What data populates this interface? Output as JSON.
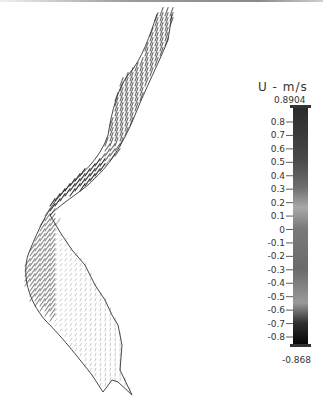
{
  "chart_data": {
    "type": "vector-field",
    "title": "",
    "colorbar": {
      "label": "U - m/s",
      "max_label": "0.8904",
      "min_label": "-0.868",
      "max": 0.8904,
      "min": -0.868,
      "ticks": [
        0.8,
        0.7,
        0.6,
        0.5,
        0.4,
        0.3,
        0.2,
        0.1,
        0,
        -0.1,
        -0.2,
        -0.3,
        -0.4,
        -0.5,
        -0.6,
        -0.7,
        -0.8
      ],
      "tick_labels": [
        "0.8",
        "0.7",
        "0.6",
        "0.5",
        "0.4",
        "0.3",
        "0.2",
        "0.1",
        "0",
        "-0.1",
        "-0.2",
        "-0.3",
        "-0.4",
        "-0.5",
        "-0.6",
        "-0.7",
        "-0.8"
      ],
      "colormap": [
        {
          "value": 0.8904,
          "color": "#2a2a2a"
        },
        {
          "value": 0.5,
          "color": "#4a4a4a"
        },
        {
          "value": 0.3,
          "color": "#6e6e6e"
        },
        {
          "value": 0.15,
          "color": "#a9a9a9"
        },
        {
          "value": 0.0,
          "color": "#7a7a7a"
        },
        {
          "value": -0.3,
          "color": "#6a6a6a"
        },
        {
          "value": -0.55,
          "color": "#9a9a9a"
        },
        {
          "value": -0.7,
          "color": "#2e2e2e"
        },
        {
          "value": -0.868,
          "color": "#050505"
        }
      ]
    },
    "regions": [
      {
        "name": "upper-channel",
        "velocity": 0.3,
        "description": "narrow upstream reach, moderate flow"
      },
      {
        "name": "bend-constriction",
        "velocity": -0.8,
        "description": "strong flow at bend"
      },
      {
        "name": "left-bank-lower",
        "velocity": 0.15,
        "description": "streaks along left bank"
      },
      {
        "name": "lower-basin",
        "velocity": 0.05,
        "description": "weak, slow vectors"
      }
    ],
    "legend": "right"
  }
}
